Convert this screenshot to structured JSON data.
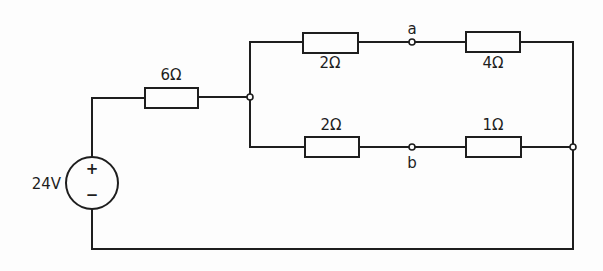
{
  "diagram": {
    "type": "circuit-schematic",
    "source": {
      "label": "24V",
      "plus": "+",
      "minus": "−"
    },
    "series_resistor": {
      "label": "6Ω"
    },
    "top_branch": {
      "r1": {
        "label": "2Ω"
      },
      "node": {
        "label": "a"
      },
      "r2": {
        "label": "4Ω"
      }
    },
    "bottom_branch": {
      "r1": {
        "label": "2Ω"
      },
      "node": {
        "label": "b"
      },
      "r2": {
        "label": "1Ω"
      }
    },
    "colors": {
      "ink": "#1e1e1e",
      "background": "#fdfdfd"
    }
  }
}
